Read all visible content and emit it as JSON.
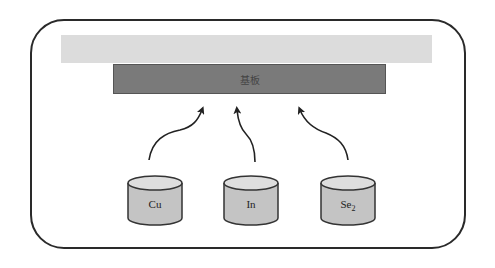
{
  "diagram": {
    "substrate": {
      "label": "基板",
      "color": "#7a7a7a"
    },
    "top_layer": {
      "color": "#dcdcdc"
    },
    "sources": [
      {
        "id": "cu",
        "label": "Cu",
        "subscript": ""
      },
      {
        "id": "in",
        "label": "In",
        "subscript": ""
      },
      {
        "id": "se",
        "label": "Se",
        "subscript": "2"
      }
    ],
    "arrows": [
      {
        "from": "Cu",
        "to": "substrate"
      },
      {
        "from": "In",
        "to": "substrate"
      },
      {
        "from": "Se2",
        "to": "substrate"
      }
    ]
  }
}
